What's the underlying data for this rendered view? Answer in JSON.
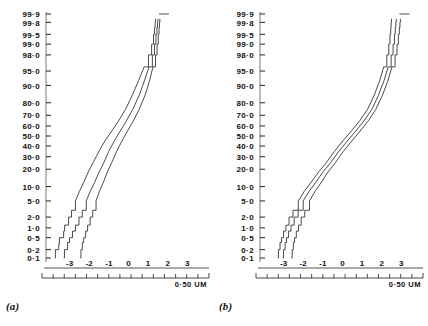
{
  "figure": {
    "caption_a": "(a)",
    "caption_b": "(b)"
  },
  "chart_data": [
    {
      "id": "panel-a",
      "type": "line",
      "title": "(a)",
      "xlabel": "",
      "ylabel": "",
      "scalebar_label": "0·50 UM",
      "grid": false,
      "legend": "none",
      "yaxis": {
        "scale": "normal-probability",
        "unit": "cumulative percent",
        "tick_labels": [
          "99·9",
          "99·8",
          "99·5",
          "99·0",
          "98·0",
          "95·0",
          "90·0",
          "80·0",
          "70·0",
          "60·0",
          "50·0",
          "40·0",
          "30·0",
          "20·0",
          "10·0",
          "5·0",
          "2·0",
          "1·0",
          "0·5",
          "0·2",
          "0·1"
        ],
        "tick_values": [
          99.9,
          99.8,
          99.5,
          99.0,
          98.0,
          95.0,
          90.0,
          80.0,
          70.0,
          60.0,
          50.0,
          40.0,
          30.0,
          20.0,
          10.0,
          5.0,
          2.0,
          1.0,
          0.5,
          0.2,
          0.1
        ],
        "ylim": [
          0.1,
          99.9
        ]
      },
      "xaxis": {
        "tick_labels": [
          "-3",
          "-2",
          "-1",
          "0",
          "1",
          "2",
          "3"
        ],
        "tick_values": [
          -3,
          -2,
          -1,
          0,
          1,
          2,
          3
        ],
        "xlim": [
          -4.2,
          3.9
        ],
        "minor_ticks": 15
      },
      "series": [
        {
          "name": "curve-1",
          "x": [
            -3.75,
            -3.72,
            -3.55,
            -3.52,
            -3.3,
            -3.25,
            -3.05,
            -2.9,
            -2.7,
            -2.5,
            -2.28,
            -2.05,
            -1.8,
            -1.5,
            -1.2,
            -0.85,
            -0.5,
            -0.15,
            0.2,
            0.52,
            0.8,
            1.02,
            1.18,
            1.28,
            1.33,
            1.36,
            1.38
          ],
          "y": [
            0.1,
            0.2,
            0.3,
            0.5,
            0.8,
            1.2,
            2.0,
            3.0,
            5.0,
            8.0,
            12.0,
            18.0,
            25.0,
            35.0,
            45.0,
            55.0,
            65.0,
            75.0,
            85.0,
            92.0,
            96.0,
            98.0,
            99.0,
            99.5,
            99.7,
            99.8,
            99.85
          ]
        },
        {
          "name": "curve-2",
          "x": [
            -3.3,
            -3.26,
            -3.1,
            -3.0,
            -2.85,
            -2.7,
            -2.52,
            -2.35,
            -2.15,
            -1.95,
            -1.72,
            -1.5,
            -1.25,
            -1.0,
            -0.72,
            -0.42,
            -0.1,
            0.22,
            0.55,
            0.82,
            1.05,
            1.22,
            1.33,
            1.4,
            1.45,
            1.48,
            1.5
          ],
          "y": [
            0.1,
            0.2,
            0.35,
            0.5,
            0.8,
            1.2,
            2.0,
            3.0,
            5.0,
            8.0,
            12.0,
            18.0,
            25.0,
            35.0,
            45.0,
            55.0,
            65.0,
            75.0,
            85.0,
            92.0,
            96.0,
            98.0,
            99.0,
            99.5,
            99.7,
            99.8,
            99.85
          ]
        },
        {
          "name": "curve-3",
          "x": [
            -2.45,
            -2.42,
            -2.35,
            -2.28,
            -2.18,
            -2.08,
            -1.95,
            -1.82,
            -1.65,
            -1.48,
            -1.28,
            -1.08,
            -0.85,
            -0.6,
            -0.33,
            -0.05,
            0.25,
            0.55,
            0.85,
            1.08,
            1.25,
            1.38,
            1.46,
            1.52,
            1.56,
            1.58,
            1.6
          ],
          "y": [
            0.1,
            0.2,
            0.35,
            0.5,
            0.8,
            1.2,
            2.0,
            3.0,
            5.0,
            8.0,
            12.0,
            18.0,
            25.0,
            35.0,
            45.0,
            55.0,
            65.0,
            75.0,
            85.0,
            92.0,
            96.0,
            98.0,
            99.0,
            99.5,
            99.7,
            99.8,
            99.85
          ]
        }
      ]
    },
    {
      "id": "panel-b",
      "type": "line",
      "title": "(b)",
      "xlabel": "",
      "ylabel": "",
      "scalebar_label": "0·50 UM",
      "grid": false,
      "legend": "none",
      "yaxis": {
        "scale": "normal-probability",
        "unit": "cumulative percent",
        "tick_labels": [
          "99·9",
          "99·8",
          "99·5",
          "99·0",
          "98·0",
          "95·0",
          "90·0",
          "80·0",
          "70·0",
          "60·0",
          "50·0",
          "40·0",
          "30·0",
          "20·0",
          "10·0",
          "5·0",
          "2·0",
          "1·0",
          "0·5",
          "0·2",
          "0·1"
        ],
        "tick_values": [
          99.9,
          99.8,
          99.5,
          99.0,
          98.0,
          95.0,
          90.0,
          80.0,
          70.0,
          60.0,
          50.0,
          40.0,
          30.0,
          20.0,
          10.0,
          5.0,
          2.0,
          1.0,
          0.5,
          0.2,
          0.1
        ],
        "ylim": [
          0.1,
          99.9
        ]
      },
      "xaxis": {
        "tick_labels": [
          "-3",
          "-2",
          "-1",
          "0",
          "1",
          "2",
          "3"
        ],
        "tick_values": [
          -3,
          -2,
          -1,
          0,
          1,
          2,
          3
        ],
        "xlim": [
          -4.2,
          3.9
        ],
        "minor_ticks": 15
      },
      "series": [
        {
          "name": "curve-1",
          "x": [
            -3.3,
            -3.26,
            -3.18,
            -3.1,
            -3.0,
            -2.88,
            -2.72,
            -2.52,
            -2.25,
            -1.95,
            -1.6,
            -1.22,
            -0.82,
            -0.4,
            0.02,
            0.45,
            0.88,
            1.28,
            1.62,
            1.9,
            2.1,
            2.26,
            2.36,
            2.42,
            2.46,
            2.48,
            2.5
          ],
          "y": [
            0.1,
            0.2,
            0.35,
            0.5,
            0.8,
            1.2,
            2.0,
            3.0,
            5.0,
            8.0,
            12.0,
            18.0,
            25.0,
            35.0,
            45.0,
            55.0,
            65.0,
            75.0,
            85.0,
            92.0,
            96.0,
            98.0,
            99.0,
            99.5,
            99.7,
            99.8,
            99.85
          ]
        },
        {
          "name": "curve-2",
          "x": [
            -3.05,
            -3.0,
            -2.92,
            -2.85,
            -2.75,
            -2.62,
            -2.46,
            -2.26,
            -2.0,
            -1.7,
            -1.36,
            -1.0,
            -0.6,
            -0.18,
            0.25,
            0.68,
            1.1,
            1.5,
            1.84,
            2.12,
            2.33,
            2.48,
            2.58,
            2.65,
            2.69,
            2.72,
            2.74
          ],
          "y": [
            0.1,
            0.2,
            0.35,
            0.5,
            0.8,
            1.2,
            2.0,
            3.0,
            5.0,
            8.0,
            12.0,
            18.0,
            25.0,
            35.0,
            45.0,
            55.0,
            65.0,
            75.0,
            85.0,
            92.0,
            96.0,
            98.0,
            99.0,
            99.5,
            99.7,
            99.8,
            99.85
          ]
        },
        {
          "name": "curve-3",
          "x": [
            -2.6,
            -2.56,
            -2.5,
            -2.44,
            -2.35,
            -2.24,
            -2.1,
            -1.92,
            -1.68,
            -1.4,
            -1.08,
            -0.74,
            -0.36,
            0.05,
            0.48,
            0.9,
            1.32,
            1.7,
            2.04,
            2.32,
            2.52,
            2.68,
            2.78,
            2.85,
            2.9,
            2.93,
            2.95
          ],
          "y": [
            0.1,
            0.2,
            0.35,
            0.5,
            0.8,
            1.2,
            2.0,
            3.0,
            5.0,
            8.0,
            12.0,
            18.0,
            25.0,
            35.0,
            45.0,
            55.0,
            65.0,
            75.0,
            85.0,
            92.0,
            96.0,
            98.0,
            99.0,
            99.5,
            99.7,
            99.8,
            99.85
          ]
        }
      ]
    }
  ]
}
